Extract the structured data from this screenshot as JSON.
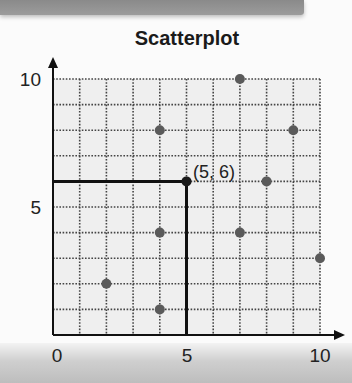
{
  "chart_data": {
    "type": "scatter",
    "title": "Scatterplot",
    "xlabel": "",
    "ylabel": "",
    "xlim": [
      0,
      10
    ],
    "ylim": [
      0,
      10
    ],
    "grid": true,
    "grid_style": "dotted",
    "xticks": [
      0,
      5,
      10
    ],
    "yticks": [
      5,
      10
    ],
    "points": [
      {
        "x": 2,
        "y": 2
      },
      {
        "x": 4,
        "y": 1
      },
      {
        "x": 4,
        "y": 4
      },
      {
        "x": 4,
        "y": 8
      },
      {
        "x": 5,
        "y": 6
      },
      {
        "x": 7,
        "y": 4
      },
      {
        "x": 7,
        "y": 10
      },
      {
        "x": 8,
        "y": 6
      },
      {
        "x": 9,
        "y": 8
      },
      {
        "x": 10,
        "y": 3
      }
    ],
    "highlight": {
      "x": 5,
      "y": 6,
      "label": "(5, 6)",
      "guide_lines": true
    },
    "colors": {
      "point": "#5a5a5a",
      "grid": "#444444",
      "background": "#efefef",
      "axis": "#111111"
    }
  },
  "labels": {
    "title": "Scatterplot",
    "x_tick_0": "0",
    "x_tick_5": "5",
    "x_tick_10": "10",
    "y_tick_5": "5",
    "y_tick_10": "10",
    "annotation": "(5, 6)"
  }
}
